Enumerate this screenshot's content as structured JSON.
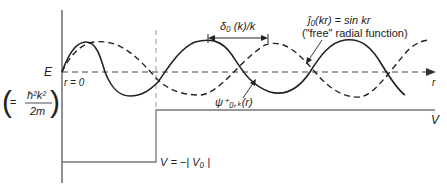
{
  "diagram": {
    "labels": {
      "energy": "E",
      "energy_def_eq": "=",
      "energy_def_num": "ħ²k²",
      "energy_def_den": "2m",
      "r_origin": "r = 0",
      "phase_shift": "δ₀ (k)/k",
      "free_fn_eq": "ĵ₀(kr) = sin kr",
      "free_fn_desc": "(\"free\" radial function)",
      "psi": "ψ⁺₀,ₖ(r)",
      "r_axis": "r",
      "potential_axis": "V",
      "well_depth": "V = −| V₀ |"
    },
    "curves": [
      {
        "name": "free radial function",
        "style": "dashed",
        "formula": "sin kr"
      },
      {
        "name": "scattering wavefunction",
        "style": "solid",
        "formula": "psi_0,k(r)"
      }
    ],
    "colors": {
      "curve": "#222222",
      "axis": "#555555",
      "potential": "#777777"
    }
  }
}
